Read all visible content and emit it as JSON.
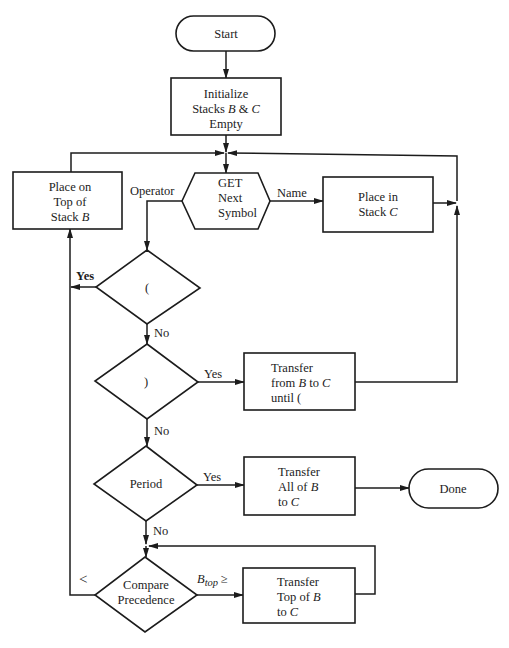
{
  "diagram": {
    "nodes": {
      "start": {
        "type": "terminal",
        "lines": [
          "Start"
        ]
      },
      "init": {
        "type": "process",
        "lines": [
          [
            "Initialize"
          ],
          [
            "Stacks ",
            {
              "i": "B"
            },
            " & ",
            {
              "i": "C"
            }
          ],
          [
            "Empty"
          ]
        ]
      },
      "get": {
        "type": "io",
        "lines": [
          [
            "GET"
          ],
          [
            "Next"
          ],
          [
            "Symbol"
          ]
        ]
      },
      "place_b": {
        "type": "process",
        "lines": [
          [
            "Place on"
          ],
          [
            "Top of"
          ],
          [
            "Stack ",
            {
              "i": "B"
            }
          ]
        ]
      },
      "place_c": {
        "type": "process",
        "lines": [
          [
            "Place in"
          ],
          [
            "Stack ",
            {
              "i": "C"
            }
          ]
        ]
      },
      "open_paren": {
        "type": "decision",
        "lines": [
          [
            "("
          ]
        ]
      },
      "close_paren": {
        "type": "decision",
        "lines": [
          [
            ")"
          ]
        ]
      },
      "transfer_until": {
        "type": "process",
        "lines": [
          [
            "Transfer"
          ],
          [
            "from ",
            {
              "i": "B"
            },
            " to ",
            {
              "i": "C"
            }
          ],
          [
            "until ("
          ]
        ]
      },
      "period": {
        "type": "decision",
        "lines": [
          [
            "Period"
          ]
        ]
      },
      "transfer_all": {
        "type": "process",
        "lines": [
          [
            "Transfer"
          ],
          [
            "All of ",
            {
              "i": "B"
            }
          ],
          [
            "to ",
            {
              "i": "C"
            }
          ]
        ]
      },
      "done": {
        "type": "terminal",
        "lines": [
          "Done"
        ]
      },
      "compare": {
        "type": "decision",
        "lines": [
          [
            "Compare"
          ],
          [
            "Precedence"
          ]
        ]
      },
      "transfer_top": {
        "type": "process",
        "lines": [
          [
            "Transfer"
          ],
          [
            "Top of ",
            {
              "i": "B"
            }
          ],
          [
            "to ",
            {
              "i": "C"
            }
          ]
        ]
      }
    },
    "edge_labels": {
      "operator": "Operator",
      "name": "Name",
      "open_yes": "Yes",
      "open_no": "No",
      "close_yes": "Yes",
      "close_no": "No",
      "period_yes": "Yes",
      "period_no": "No",
      "less_than": "<",
      "btop_main": "B",
      "btop_sub": "top",
      "btop_op": "≥"
    }
  }
}
